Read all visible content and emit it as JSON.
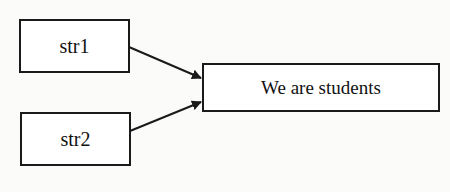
{
  "diagram": {
    "nodes": [
      {
        "id": "str1",
        "label": "str1"
      },
      {
        "id": "str2",
        "label": "str2"
      },
      {
        "id": "result",
        "label": "We are students"
      }
    ],
    "edges": [
      {
        "from": "str1",
        "to": "result"
      },
      {
        "from": "str2",
        "to": "result"
      }
    ],
    "colors": {
      "stroke": "#1a1a1a",
      "background": "#fbfbfa"
    }
  }
}
